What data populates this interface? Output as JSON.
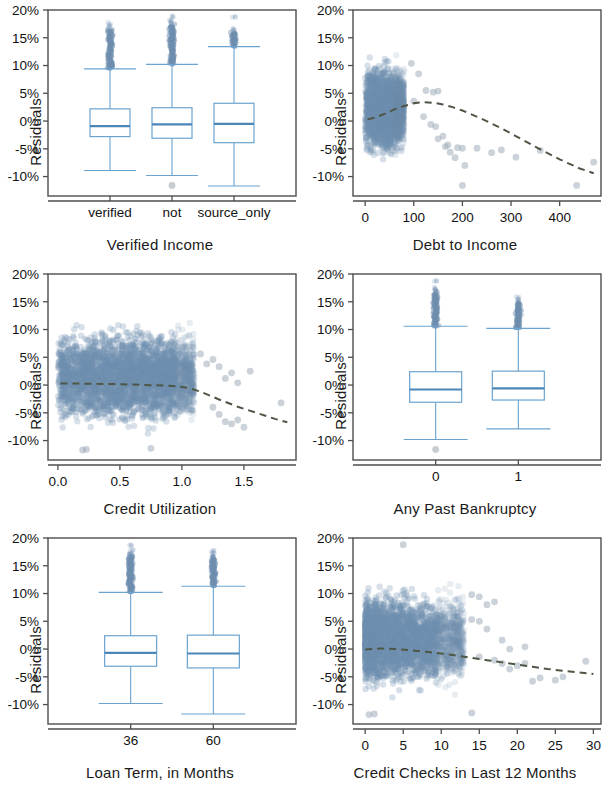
{
  "figure": {
    "type": "residual-diagnostic-panel-grid",
    "panel_count": 6,
    "layout": "2 columns x 3 rows",
    "shared_ylabel": "Residuals",
    "colors": {
      "box_stroke": "#6ba3cf",
      "box_median": "#4a86b8",
      "point_fill": "#6e8fb0",
      "trend_line": "#4e5645",
      "frame": "#4d4d4d",
      "background": "#ffffff"
    }
  },
  "chart_data": [
    {
      "id": "verified-income",
      "type": "box",
      "title": "",
      "xlabel": "Verified Income",
      "ylabel": "Residuals",
      "categories": [
        "verified",
        "not",
        "source_only"
      ],
      "ytick_labels": [
        "20%",
        "15%",
        "10%",
        "5%",
        "0%",
        "-5%",
        "-10%"
      ],
      "ytick_values": [
        20,
        15,
        10,
        5,
        0,
        -5,
        -10
      ],
      "ylim": [
        -13.5,
        20
      ],
      "grid": false,
      "boxes": [
        {
          "category": "verified",
          "whisker_low": -8.9,
          "q1": -2.8,
          "median": -0.9,
          "q3": 2.2,
          "whisker_high": 9.4,
          "outliers_high": [
            9.6,
            10.1,
            10.5,
            11.0,
            11.6,
            12.1,
            12.7,
            13.2,
            13.8,
            14.3,
            14.9,
            15.4,
            16.0,
            16.5,
            17.1,
            17.5
          ],
          "outliers_low": []
        },
        {
          "category": "not",
          "whisker_low": -9.8,
          "q1": -3.1,
          "median": -0.6,
          "q3": 2.4,
          "whisker_high": 10.2,
          "outliers_high": [
            10.4,
            10.9,
            11.4,
            11.9,
            12.4,
            12.9,
            13.4,
            13.9,
            14.4,
            14.9,
            15.4,
            15.9,
            16.4,
            17.0,
            17.6,
            18.2,
            18.8
          ],
          "outliers_low": [
            -11.6
          ]
        },
        {
          "category": "source_only",
          "whisker_low": -11.7,
          "q1": -3.9,
          "median": -0.5,
          "q3": 3.2,
          "whisker_high": 13.4,
          "outliers_high": [
            13.6,
            14.1,
            14.6,
            15.1,
            15.6,
            16.1,
            16.6,
            18.7
          ],
          "outliers_low": []
        }
      ]
    },
    {
      "id": "debt-to-income",
      "type": "scatter",
      "title": "",
      "xlabel": "Debt to Income",
      "ylabel": "Residuals",
      "xtick_labels": [
        "0",
        "100",
        "200",
        "300",
        "400"
      ],
      "xtick_values": [
        0,
        100,
        200,
        300,
        400
      ],
      "xlim": [
        -25,
        485
      ],
      "ytick_labels": [
        "20%",
        "15%",
        "10%",
        "5%",
        "0%",
        "-5%",
        "-10%"
      ],
      "ytick_values": [
        20,
        15,
        10,
        5,
        0,
        -5,
        -10
      ],
      "ylim": [
        -13.5,
        20
      ],
      "grid": false,
      "point_count_approx": 9000,
      "cluster": {
        "x_range": [
          0,
          80
        ],
        "y_range": [
          -10,
          18
        ],
        "description": "dense vertical band of residuals at low debt-to-income"
      },
      "trend_line": {
        "style": "dashed",
        "x": [
          5,
          20,
          40,
          60,
          80,
          100,
          120,
          140,
          160,
          180,
          200,
          240,
          280,
          320,
          360,
          400,
          440,
          470
        ],
        "y": [
          0.3,
          0.6,
          1.3,
          2.1,
          2.7,
          3.2,
          3.4,
          3.3,
          3.0,
          2.5,
          1.9,
          0.4,
          -1.3,
          -3.2,
          -5.1,
          -6.9,
          -8.5,
          -9.4
        ]
      },
      "sparse_points": [
        [
          95,
          10.4
        ],
        [
          110,
          8.5
        ],
        [
          125,
          5.5
        ],
        [
          140,
          5.2
        ],
        [
          150,
          5.4
        ],
        [
          100,
          3.6
        ],
        [
          120,
          0.8
        ],
        [
          135,
          -0.6
        ],
        [
          145,
          -1.0
        ],
        [
          150,
          -3.2
        ],
        [
          160,
          -2.7
        ],
        [
          165,
          -4.6
        ],
        [
          170,
          -4.3
        ],
        [
          175,
          -5.6
        ],
        [
          185,
          -6.6
        ],
        [
          190,
          -4.8
        ],
        [
          200,
          -4.9
        ],
        [
          205,
          -8.0
        ],
        [
          200,
          -11.6
        ],
        [
          230,
          -4.9
        ],
        [
          260,
          -5.7
        ],
        [
          280,
          -5.2
        ],
        [
          310,
          -6.5
        ],
        [
          360,
          -5.3
        ],
        [
          435,
          -11.6
        ],
        [
          470,
          -7.4
        ]
      ]
    },
    {
      "id": "credit-utilization",
      "type": "scatter",
      "title": "",
      "xlabel": "Credit Utilization",
      "ylabel": "Residuals",
      "xtick_labels": [
        "0.0",
        "0.5",
        "1.0",
        "1.5"
      ],
      "xtick_values": [
        0.0,
        0.5,
        1.0,
        1.5
      ],
      "xlim": [
        -0.08,
        1.92
      ],
      "ytick_labels": [
        "20%",
        "15%",
        "10%",
        "5%",
        "0%",
        "-5%",
        "-10%"
      ],
      "ytick_values": [
        20,
        15,
        10,
        5,
        0,
        -5,
        -10
      ],
      "ylim": [
        -13.5,
        20
      ],
      "grid": false,
      "point_count_approx": 9000,
      "cluster": {
        "x_range": [
          0,
          1.1
        ],
        "y_range": [
          -10,
          18
        ],
        "description": "dense cloud spanning full residual range up to utilization 1.1"
      },
      "trend_line": {
        "style": "dashed",
        "x": [
          0.02,
          0.2,
          0.4,
          0.6,
          0.8,
          0.95,
          1.05,
          1.15,
          1.3,
          1.45,
          1.6,
          1.75,
          1.85
        ],
        "y": [
          0.3,
          0.25,
          0.2,
          0.1,
          -0.05,
          -0.2,
          -0.5,
          -1.2,
          -2.6,
          -3.9,
          -5.0,
          -6.1,
          -6.7
        ]
      },
      "sparse_points": [
        [
          1.15,
          5.6
        ],
        [
          1.2,
          3.8
        ],
        [
          1.25,
          4.6
        ],
        [
          1.3,
          3.3
        ],
        [
          1.35,
          1.2
        ],
        [
          1.4,
          2.2
        ],
        [
          1.45,
          0.4
        ],
        [
          1.55,
          2.5
        ],
        [
          1.25,
          -4.0
        ],
        [
          1.3,
          -5.3
        ],
        [
          1.35,
          -6.6
        ],
        [
          1.4,
          -7.0
        ],
        [
          1.45,
          -6.3
        ],
        [
          1.5,
          -7.6
        ],
        [
          1.8,
          -3.2
        ],
        [
          0.2,
          -11.7
        ],
        [
          0.23,
          -11.6
        ],
        [
          0.75,
          -11.4
        ]
      ]
    },
    {
      "id": "any-past-bankruptcy",
      "type": "box",
      "title": "",
      "xlabel": "Any Past Bankruptcy",
      "ylabel": "Residuals",
      "categories": [
        "0",
        "1"
      ],
      "ytick_labels": [
        "20%",
        "15%",
        "10%",
        "5%",
        "0%",
        "-5%",
        "-10%"
      ],
      "ytick_values": [
        20,
        15,
        10,
        5,
        0,
        -5,
        -10
      ],
      "ylim": [
        -13.5,
        20
      ],
      "grid": false,
      "boxes": [
        {
          "category": "0",
          "whisker_low": -9.8,
          "q1": -3.1,
          "median": -0.8,
          "q3": 2.4,
          "whisker_high": 10.6,
          "outliers_high": [
            10.8,
            11.3,
            11.8,
            12.3,
            12.8,
            13.3,
            13.8,
            14.3,
            14.8,
            15.3,
            15.8,
            16.3,
            16.9,
            17.4,
            18.8
          ],
          "outliers_low": [
            -11.6
          ]
        },
        {
          "category": "1",
          "whisker_low": -7.9,
          "q1": -2.7,
          "median": -0.6,
          "q3": 2.5,
          "whisker_high": 10.2,
          "outliers_high": [
            10.4,
            10.9,
            11.4,
            11.9,
            12.4,
            12.9,
            13.4,
            13.9,
            14.4,
            14.9,
            15.4,
            15.9
          ],
          "outliers_low": []
        }
      ]
    },
    {
      "id": "loan-term",
      "type": "box",
      "title": "",
      "xlabel": "Loan Term, in Months",
      "ylabel": "Residuals",
      "categories": [
        "36",
        "60"
      ],
      "ytick_labels": [
        "20%",
        "15%",
        "10%",
        "5%",
        "0%",
        "-5%",
        "-10%"
      ],
      "ytick_values": [
        20,
        15,
        10,
        5,
        0,
        -5,
        -10
      ],
      "ylim": [
        -13.5,
        20
      ],
      "grid": false,
      "boxes": [
        {
          "category": "36",
          "whisker_low": -9.8,
          "q1": -3.1,
          "median": -0.7,
          "q3": 2.4,
          "whisker_high": 10.2,
          "outliers_high": [
            10.4,
            10.9,
            11.4,
            11.9,
            12.4,
            12.9,
            13.4,
            13.9,
            14.4,
            14.9,
            15.4,
            16.0,
            16.6,
            17.2,
            17.8,
            18.7
          ],
          "outliers_low": []
        },
        {
          "category": "60",
          "whisker_low": -11.7,
          "q1": -3.4,
          "median": -0.8,
          "q3": 2.5,
          "whisker_high": 11.3,
          "outliers_high": [
            11.5,
            12.0,
            12.5,
            13.0,
            13.5,
            14.0,
            14.5,
            15.0,
            15.5,
            16.0,
            16.6,
            17.2,
            17.6
          ],
          "outliers_low": []
        }
      ]
    },
    {
      "id": "credit-checks",
      "type": "scatter",
      "title": "",
      "xlabel": "Credit Checks in Last 12 Months",
      "ylabel": "Residuals",
      "xtick_labels": [
        "0",
        "5",
        "10",
        "15",
        "20",
        "25",
        "30"
      ],
      "xtick_values": [
        0,
        5,
        10,
        15,
        20,
        25,
        30
      ],
      "xlim": [
        -1.6,
        31
      ],
      "ytick_labels": [
        "20%",
        "15%",
        "10%",
        "5%",
        "0%",
        "-5%",
        "-10%"
      ],
      "ytick_values": [
        20,
        15,
        10,
        5,
        0,
        -5,
        -10
      ],
      "ylim": [
        -13.5,
        20
      ],
      "grid": false,
      "point_count_approx": 9000,
      "cluster": {
        "x_range": [
          0,
          13
        ],
        "y_range": [
          -10,
          18
        ],
        "description": "dense cloud thinning out beyond 12 credit checks"
      },
      "trend_line": {
        "style": "dashed",
        "x": [
          0,
          2,
          4,
          6,
          8,
          10,
          12,
          14,
          16,
          18,
          20,
          22,
          24,
          26,
          28,
          30
        ],
        "y": [
          -0.1,
          0.1,
          0.0,
          -0.2,
          -0.5,
          -0.8,
          -1.2,
          -1.6,
          -2.0,
          -2.4,
          -2.8,
          -3.2,
          -3.6,
          -3.9,
          -4.2,
          -4.5
        ]
      },
      "sparse_points": [
        [
          14,
          9.8
        ],
        [
          15,
          9.4
        ],
        [
          16,
          8.0
        ],
        [
          17,
          8.5
        ],
        [
          14,
          5.3
        ],
        [
          15,
          5.0
        ],
        [
          16,
          3.6
        ],
        [
          18,
          1.6
        ],
        [
          19,
          0.0
        ],
        [
          21,
          0.4
        ],
        [
          15,
          -1.4
        ],
        [
          17,
          -2.0
        ],
        [
          18,
          -2.6
        ],
        [
          19,
          -3.6
        ],
        [
          20,
          -3.0
        ],
        [
          21,
          -2.6
        ],
        [
          22,
          -5.8
        ],
        [
          23,
          -5.2
        ],
        [
          25,
          -5.6
        ],
        [
          26,
          -5.0
        ],
        [
          29,
          -2.2
        ],
        [
          14,
          -11.5
        ],
        [
          0.5,
          -11.8
        ],
        [
          1.2,
          -11.7
        ],
        [
          5,
          18.8
        ]
      ]
    }
  ]
}
